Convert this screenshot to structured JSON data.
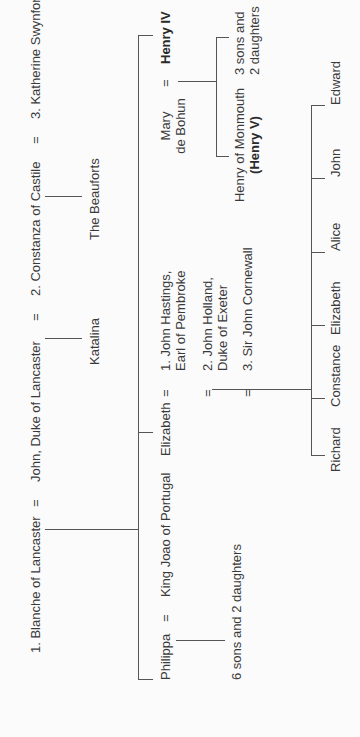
{
  "diagram": {
    "type": "family-tree",
    "orientation": "rotated-90-ccw",
    "marriage_symbol": "=",
    "generation_1": {
      "spouses": [
        {
          "label": "1. Blanche of Lancaster"
        },
        {
          "label": "John, Duke of Lancaster"
        },
        {
          "label": "2. Constanza of Castile"
        },
        {
          "label": "3. Katherine Swynford"
        }
      ],
      "children_groups": [
        {
          "parents": "Constanza of Castile",
          "label": "Katalina"
        },
        {
          "parents": "Katherine Swynford",
          "label": "The Beauforts"
        }
      ]
    },
    "generation_2": {
      "philippa": {
        "name": "Philippa",
        "spouse": "King Joao of Portugal",
        "children": "6 sons and 2 daughters"
      },
      "elizabeth": {
        "name": "Elizabeth",
        "spouses": [
          {
            "line1": "1. John Hastings,",
            "line2": "Earl of Pembroke"
          },
          {
            "line1": "2. John Holland,",
            "line2": "Duke of Exeter"
          },
          {
            "line1": "3. Sir John Cornewall",
            "line2": ""
          }
        ],
        "children": [
          "Richard",
          "Constance",
          "Elizabeth",
          "Alice",
          "John",
          "Edward"
        ]
      },
      "henry_iv": {
        "name": "Henry IV",
        "spouse_line1": "Mary",
        "spouse_line2": "de Bohun",
        "children": [
          {
            "line1": "Henry of Monmouth",
            "line2": "(Henry V)"
          },
          {
            "line1": "3 sons and",
            "line2": "2 daughters"
          }
        ]
      }
    }
  }
}
